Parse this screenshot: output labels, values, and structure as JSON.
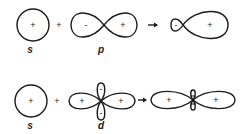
{
  "rows": [
    {
      "name": "s-p-hybridization",
      "orbital_a": {
        "label": "s",
        "sign": "+"
      },
      "operator": "+",
      "orbital_b": {
        "label": "p",
        "left_sign": "-",
        "right_sign": "+"
      },
      "arrow": "→",
      "result": {
        "small_lobe_sign": "-",
        "large_lobe_sign": "+"
      }
    },
    {
      "name": "s-d-hybridization",
      "orbital_a": {
        "label": "s",
        "sign": "+"
      },
      "operator": "+",
      "orbital_b": {
        "label": "d",
        "left_sign": "+",
        "right_sign": "+",
        "top_sign": "-",
        "bottom_sign": "-"
      },
      "arrow": "→",
      "result": {
        "left_sign": "+",
        "right_sign": "+"
      }
    }
  ]
}
